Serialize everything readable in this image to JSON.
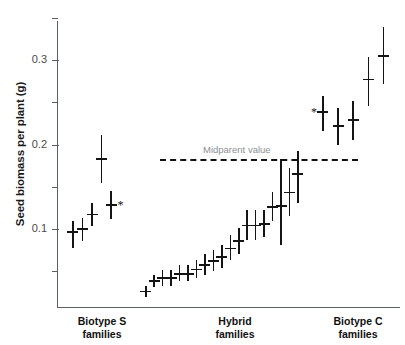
{
  "chart_data": {
    "type": "scatter",
    "title": "",
    "xlabel": "",
    "ylabel": "Seed biomass per plant (g)",
    "ylim": [
      0.015,
      0.355
    ],
    "ytick_labels": [
      "0.1",
      "0.2",
      "0.3"
    ],
    "ytick_values": [
      0.1,
      0.2,
      0.3
    ],
    "yminor_values": [
      0.05,
      0.15,
      0.25,
      0.35
    ],
    "grid": false,
    "legend": "none",
    "annotations": [
      {
        "name": "midparent-value",
        "label": "Midparent value",
        "y": 0.183,
        "style": "dashed-horizontal-line"
      },
      {
        "name": "significance-star-biotype-s",
        "label": "*",
        "group": "Biotype S families",
        "point_index": 5
      },
      {
        "name": "significance-star-biotype-c",
        "label": "*",
        "group": "Biotype C families",
        "point_index": 0
      }
    ],
    "error_bar_type": "mean with vertical range bar",
    "groups": [
      {
        "name": "Biotype S families",
        "label_line1": "Biotype S",
        "label_line2": "families",
        "points": [
          {
            "mean": 0.096,
            "low": 0.078,
            "high": 0.109
          },
          {
            "mean": 0.1,
            "low": 0.086,
            "high": 0.113
          },
          {
            "mean": 0.117,
            "low": 0.103,
            "high": 0.131
          },
          {
            "mean": 0.183,
            "low": 0.154,
            "high": 0.211
          },
          {
            "mean": 0.128,
            "low": 0.112,
            "high": 0.145
          },
          {
            "mean": 0.128,
            "low": 0.128,
            "high": 0.128,
            "marker": "star-only"
          }
        ]
      },
      {
        "name": "Hybrid families",
        "label_line1": "Hybrid",
        "label_line2": "families",
        "points": [
          {
            "mean": 0.026,
            "low": 0.02,
            "high": 0.033
          },
          {
            "mean": 0.038,
            "low": 0.031,
            "high": 0.046
          },
          {
            "mean": 0.042,
            "low": 0.033,
            "high": 0.051
          },
          {
            "mean": 0.042,
            "low": 0.033,
            "high": 0.051
          },
          {
            "mean": 0.047,
            "low": 0.038,
            "high": 0.057
          },
          {
            "mean": 0.047,
            "low": 0.038,
            "high": 0.057
          },
          {
            "mean": 0.052,
            "low": 0.042,
            "high": 0.063
          },
          {
            "mean": 0.057,
            "low": 0.045,
            "high": 0.07
          },
          {
            "mean": 0.062,
            "low": 0.05,
            "high": 0.075
          },
          {
            "mean": 0.067,
            "low": 0.054,
            "high": 0.081
          },
          {
            "mean": 0.077,
            "low": 0.063,
            "high": 0.093
          },
          {
            "mean": 0.086,
            "low": 0.07,
            "high": 0.101
          },
          {
            "mean": 0.104,
            "low": 0.087,
            "high": 0.122
          },
          {
            "mean": 0.104,
            "low": 0.087,
            "high": 0.122
          },
          {
            "mean": 0.106,
            "low": 0.091,
            "high": 0.123
          },
          {
            "mean": 0.126,
            "low": 0.11,
            "high": 0.144
          },
          {
            "mean": 0.127,
            "low": 0.081,
            "high": 0.183
          },
          {
            "mean": 0.143,
            "low": 0.115,
            "high": 0.172
          },
          {
            "mean": 0.165,
            "low": 0.131,
            "high": 0.192
          }
        ]
      },
      {
        "name": "Biotype C families",
        "label_line1": "Biotype C",
        "label_line2": "families",
        "points": [
          {
            "mean": 0.238,
            "low": 0.216,
            "high": 0.257
          },
          {
            "mean": 0.222,
            "low": 0.199,
            "high": 0.243
          },
          {
            "mean": 0.229,
            "low": 0.205,
            "high": 0.252
          },
          {
            "mean": 0.277,
            "low": 0.245,
            "high": 0.303
          },
          {
            "mean": 0.305,
            "low": 0.271,
            "high": 0.339
          }
        ]
      }
    ]
  },
  "axes": {
    "y_axis_label": "Seed biomass per plant (g)"
  }
}
